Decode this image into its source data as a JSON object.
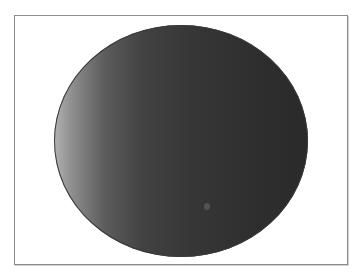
{
  "figure": {
    "top_cropped_text": "",
    "frame": {
      "border_color": "#8c8c8c",
      "background": "#ffffff"
    },
    "shape": {
      "type": "ellipse",
      "gradient_start": "#b2b2b2",
      "gradient_end": "#2a2a2a",
      "outline_color": "#3a3a3a"
    },
    "spot": {
      "color": "#5a5a5a"
    }
  }
}
